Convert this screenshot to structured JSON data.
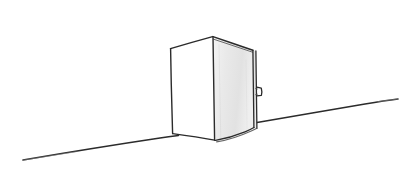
{
  "artwork": {
    "title": "Open Door Sketch",
    "medium": "hand-drawn line sketch",
    "background_color": "#ffffff",
    "ink_color": "#2b2b2b",
    "soft_ink_color": "#4a4a4a",
    "faint_ink_color": "#8d8d8d",
    "canvas": {
      "width": 409,
      "height": 181
    }
  },
  "elements": {
    "ground_line_left": {
      "name": "ground-line-left",
      "path": "M23,160 C70,152 120,144 160,138 C168,136.8 174,136 178.5,135.4",
      "stroke_width": 1.5,
      "color": "#2b2b2b"
    },
    "ground_line_right": {
      "name": "ground-line-right",
      "path": "M257,122.5 C290,117 330,110 365,104 C378,101.8 390,100 398,99",
      "stroke_width": 1.5,
      "color": "#2b2b2b"
    },
    "wall_panel": {
      "name": "door-frame-panel",
      "fill": "#ffffff",
      "path": "M170.5,48.5 L212.5,36.5 L214.5,140 L172.5,133.5 Z",
      "stroke_width": 1.4,
      "color": "#2b2b2b"
    },
    "door_panel_face": {
      "name": "door-panel-face",
      "fill_start": "#f2f2f2",
      "fill_mid": "#e4e4e4",
      "fill_end": "#ededed",
      "path": "M213,36.5 L252.5,50 L253.5,127.5 C241,133.5 228,138.5 215.5,140.5 C214,135 214,128 214,120 Z",
      "stroke_width": 1.4,
      "color": "#2b2b2b"
    },
    "door_edge_thickness": {
      "name": "door-edge-thickness",
      "path": "M216,36.5 L255.5,50.5 L256.5,128 C248,131.5 242,134.5 236,137",
      "stroke_width": 1.2,
      "color": "#3a3a3a"
    },
    "door_top_bevel": {
      "name": "door-top-bevel",
      "path": "M213.5,38.5 L253,51.5",
      "stroke_width": 1.0,
      "color": "#5a5a5a"
    },
    "door_handle": {
      "name": "door-handle",
      "path": "M256.5,87 L261,88 L261.5,95 L256.5,95.5",
      "stroke_width": 1.3,
      "color": "#2b2b2b"
    },
    "door_handle_stem": {
      "name": "door-handle-stem",
      "path": "M255.5,88.5 L257,88.8 M255.5,94.5 L257,94.3",
      "stroke_width": 1.1,
      "color": "#3a3a3a"
    },
    "hinge_crease": {
      "name": "hinge-crease-line",
      "path": "M212.8,36.8 L214.6,140.2",
      "stroke_width": 1.4,
      "color": "#2b2b2b"
    },
    "door_bottom_curve": {
      "name": "door-bottom-edge",
      "path": "M215.5,140.5 C228,138 241,133.5 253.5,127.5",
      "stroke_width": 1.4,
      "color": "#2b2b2b"
    },
    "panel_left_edge": {
      "name": "frame-left-edge",
      "path": "M170.5,48.5 L172.5,133.5",
      "stroke_width": 1.4,
      "color": "#2b2b2b"
    },
    "panel_top_edge": {
      "name": "frame-top-edge",
      "path": "M170.5,48.5 L212.5,36.5",
      "stroke_width": 1.4,
      "color": "#2b2b2b"
    },
    "panel_bottom_edge": {
      "name": "frame-bottom-edge",
      "path": "M172.5,133.5 L214.6,140.2",
      "stroke_width": 1.3,
      "color": "#2b2b2b"
    },
    "shadow_wash": {
      "name": "door-shadow-wash",
      "opacity": 0.12
    }
  }
}
